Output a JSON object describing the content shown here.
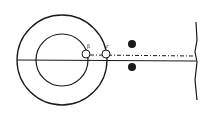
{
  "diagram": {
    "type": "optical-schematic",
    "colors": {
      "ink": "#1a1a1a",
      "background": "#ffffff"
    },
    "labels": {
      "left_point": "β",
      "right_point": "r"
    },
    "elements": [
      {
        "name": "outer-circle",
        "cx": 62,
        "cy": 60,
        "r": 45
      },
      {
        "name": "inner-circle",
        "cx": 62,
        "cy": 60,
        "r": 26
      },
      {
        "name": "horizontal-axis",
        "x1": 17,
        "y1": 60,
        "x2": 196,
        "y2": 60
      },
      {
        "name": "small-circle-left",
        "cx": 86,
        "cy": 54,
        "r": 4
      },
      {
        "name": "small-circle-right",
        "cx": 106,
        "cy": 54,
        "r": 4
      },
      {
        "name": "dot-upper",
        "cx": 132,
        "cy": 44,
        "r": 4
      },
      {
        "name": "dot-lower",
        "cx": 132,
        "cy": 67,
        "r": 4
      },
      {
        "name": "dashed-ray",
        "x1": 90,
        "y1": 55,
        "x2": 195,
        "y2": 56
      },
      {
        "name": "vertical-screen",
        "x": 196,
        "y1": 22,
        "y2": 100
      }
    ]
  }
}
